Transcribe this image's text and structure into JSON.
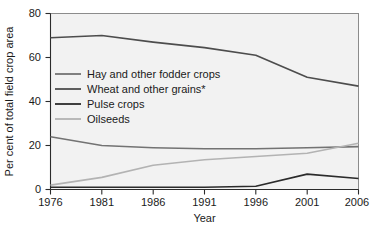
{
  "chart_data": {
    "type": "line",
    "title": "",
    "xlabel": "Year",
    "ylabel": "Per cent of total field crop area",
    "x": [
      1976,
      1981,
      1986,
      1991,
      1996,
      2001,
      2006
    ],
    "xticklabels": [
      "1976",
      "1981",
      "1986",
      "1991",
      "1996",
      "2001",
      "2006"
    ],
    "yticks": [
      0,
      20,
      40,
      60,
      80
    ],
    "yticklabels": [
      "0",
      "20",
      "40",
      "60",
      "80"
    ],
    "xlim": [
      1976,
      2006
    ],
    "ylim": [
      0,
      80
    ],
    "grid": false,
    "legend_position": "upper-left-inside",
    "series": [
      {
        "name": "Hay and other fodder crops",
        "color": "#737373",
        "values": [
          24,
          20,
          19,
          18.5,
          18.5,
          19,
          19.5
        ]
      },
      {
        "name": "Wheat and other grains*",
        "color": "#4d4d4d",
        "values": [
          69,
          70,
          67,
          64.5,
          61,
          51,
          47
        ]
      },
      {
        "name": "Pulse crops",
        "color": "#2b2b2b",
        "values": [
          1,
          1,
          1,
          1,
          1.5,
          7,
          5
        ]
      },
      {
        "name": "Oilseeds",
        "color": "#b3b3b3",
        "values": [
          2,
          5.5,
          11,
          13.5,
          15,
          16.5,
          21
        ]
      }
    ]
  },
  "axes": {
    "y_title": "Per cent of total field crop area",
    "x_title": "Year",
    "ytick_0": "0",
    "ytick_1": "20",
    "ytick_2": "40",
    "ytick_3": "60",
    "ytick_4": "80",
    "xtick_0": "1976",
    "xtick_1": "1981",
    "xtick_2": "1986",
    "xtick_3": "1991",
    "xtick_4": "1996",
    "xtick_5": "2001",
    "xtick_6": "2006"
  },
  "legend": {
    "item_0": "Hay and other fodder crops",
    "item_1": "Wheat and other grains*",
    "item_2": "Pulse crops",
    "item_3": "Oilseeds"
  }
}
